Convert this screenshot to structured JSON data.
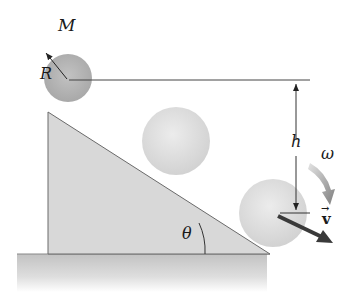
{
  "diagram": {
    "labels": {
      "mass": "M",
      "radius": "R",
      "height": "h",
      "angular_velocity": "ω",
      "velocity": "v",
      "velocity_arrow": "→",
      "angle": "θ"
    },
    "objects": [
      {
        "name": "sphere-top",
        "description": "sphere of mass M and radius R at top of incline",
        "cx": 68,
        "cy": 78,
        "r": 24
      },
      {
        "name": "sphere-middle",
        "description": "sphere rolling midway down incline",
        "cx": 176,
        "cy": 141,
        "r": 34
      },
      {
        "name": "sphere-bottom",
        "description": "sphere at bottom of incline with velocity v and angular velocity ω",
        "cx": 273,
        "cy": 213,
        "r": 34
      }
    ],
    "incline": {
      "top": [
        48,
        112
      ],
      "bottom_left": [
        48,
        254
      ],
      "bottom_right": [
        270,
        254
      ]
    },
    "colors": {
      "sphere_top": "#b0b0b0",
      "sphere_light": "#dcdcdc",
      "incline_fill": "#d6d6d6",
      "ground_top": "#c4c4c4",
      "ground_bottom": "#ffffff",
      "line": "#555555",
      "arrow_dark": "#404040",
      "omega_arrow": "#8a8a8a"
    }
  }
}
